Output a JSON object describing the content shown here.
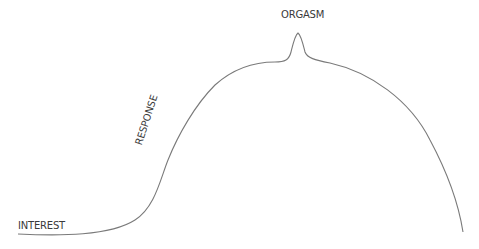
{
  "diagram": {
    "type": "response-curve",
    "line_color": "#7a7a7a",
    "text_color": "#3a3a3a",
    "labels": {
      "interest": "INTEREST",
      "response": "RESPONSE",
      "orgasm": "ORGASM"
    },
    "stages": [
      "INTEREST",
      "RESPONSE",
      "ORGASM"
    ]
  }
}
